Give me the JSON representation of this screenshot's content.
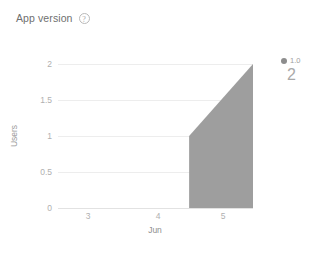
{
  "header": {
    "title": "App version",
    "help_icon": "question-circle-icon",
    "help_glyph": "?"
  },
  "legend": {
    "marker_color": "#8d8d8d",
    "label": "1.0",
    "value": "2"
  },
  "chart_data": {
    "type": "area",
    "title": "App version",
    "xlabel": "Jun",
    "ylabel": "Users",
    "xlim": [
      2.55,
      5.45
    ],
    "ylim": [
      0,
      2
    ],
    "x_ticks": [
      "3",
      "4",
      "5"
    ],
    "x_tick_values": [
      3,
      4,
      5
    ],
    "y_ticks": [
      "0",
      "0.5",
      "1",
      "1.5",
      "2"
    ],
    "y_tick_values": [
      0,
      0.5,
      1,
      1.5,
      2
    ],
    "grid": true,
    "legend_position": "right",
    "series": [
      {
        "name": "1.0",
        "color": "#9e9e9e",
        "x": [
          4.5,
          5.45
        ],
        "values": [
          1,
          2
        ]
      }
    ],
    "total": 2
  }
}
